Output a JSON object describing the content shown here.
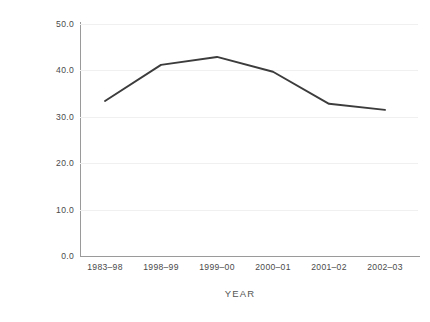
{
  "chart_data": {
    "type": "line",
    "title": "",
    "subtitle": "",
    "xlabel": "YEAR",
    "ylabel": "PERCENTAGE",
    "categories": [
      "1983–98",
      "1998–99",
      "1999–00",
      "2000–01",
      "2001–02",
      "2002–03"
    ],
    "values": [
      33.4,
      41.2,
      42.9,
      39.7,
      32.8,
      31.5
    ],
    "series": [
      {
        "name": "percentage",
        "values": [
          33.4,
          41.2,
          42.9,
          39.7,
          32.8,
          31.5
        ]
      }
    ],
    "ylim": [
      0.0,
      50.0
    ],
    "ytick_labels": [
      "0.0",
      "10.0",
      "20.0",
      "30.0",
      "40.0",
      "50.0"
    ],
    "ytick_values": [
      0.0,
      10.0,
      20.0,
      30.0,
      40.0,
      50.0
    ],
    "xtick_labels": [
      "1983–98",
      "1998–99",
      "1999–00",
      "2000–01",
      "2001–02",
      "2002–03"
    ],
    "grid": "horizontal",
    "legend": "none",
    "line_color": "#3c3c3c",
    "grid_color": "#f0f0f0",
    "axis_color": "#9a9a9a",
    "background_color": "#ffffff",
    "text_color": "#4a4a4a",
    "annotations": []
  },
  "axes": {
    "y_title": "PERCENTAGE",
    "x_title": "YEAR"
  }
}
